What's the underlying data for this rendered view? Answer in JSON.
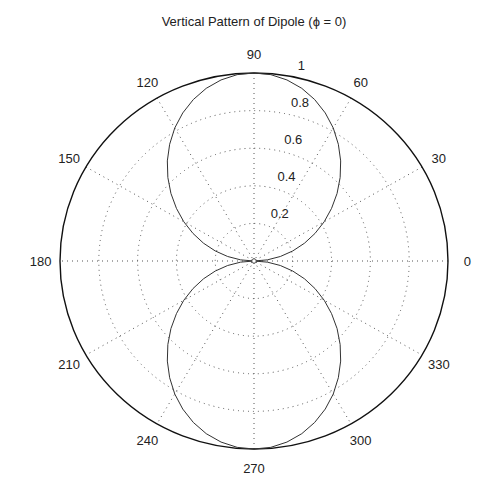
{
  "chart_data": {
    "type": "polar-line",
    "title": "Vertical Pattern of Dipole (ϕ = 0)",
    "radial_ticks": [
      0.2,
      0.4,
      0.6,
      0.8,
      1
    ],
    "radial_tick_labels": [
      "0.2",
      "0.4",
      "0.6",
      "0.8",
      "1"
    ],
    "angle_ticks_deg": [
      0,
      30,
      60,
      90,
      120,
      150,
      180,
      210,
      240,
      270,
      300,
      330
    ],
    "angle_tick_labels": [
      "0",
      "30",
      "60",
      "90",
      "120",
      "150",
      "180",
      "210",
      "240",
      "270",
      "300",
      "330"
    ],
    "rlim": [
      0,
      1
    ],
    "grid": true,
    "series": [
      {
        "name": "dipole",
        "formula": "cos(pi/2*cos(theta))/sin(theta)",
        "theta_deg": [
          0,
          5,
          10,
          15,
          20,
          25,
          30,
          35,
          40,
          45,
          50,
          55,
          60,
          65,
          70,
          75,
          80,
          85,
          90
        ],
        "r": [
          0,
          0.069,
          0.138,
          0.207,
          0.277,
          0.347,
          0.418,
          0.488,
          0.559,
          0.628,
          0.695,
          0.758,
          0.817,
          0.869,
          0.914,
          0.951,
          0.978,
          0.995,
          1.0
        ]
      }
    ]
  },
  "colors": {
    "axis": "#111111",
    "grid": "#555555",
    "line": "#333333",
    "text": "#222222"
  }
}
